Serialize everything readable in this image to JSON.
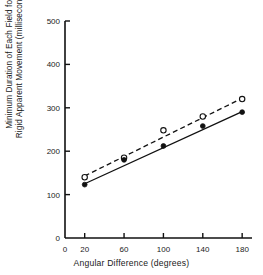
{
  "chart_data": {
    "type": "scatter",
    "title": "",
    "subtitle": "",
    "xlabel": "Angular Difference (degrees)",
    "ylabel_line1": "Minimum Duration of Each Field for",
    "ylabel_line2": "Rigid Apparent Movement (milliseconds)",
    "xlim": [
      0,
      190
    ],
    "ylim": [
      0,
      500
    ],
    "xticks": [
      0,
      20,
      60,
      100,
      140,
      180
    ],
    "xtick_labels": [
      "0",
      "20",
      "60",
      "100",
      "140",
      "180"
    ],
    "yticks": [
      0,
      100,
      200,
      300,
      400,
      500
    ],
    "ytick_labels": [
      "0",
      "100",
      "200",
      "300",
      "400",
      "500"
    ],
    "grid": false,
    "legend": "none",
    "x": [
      20,
      60,
      100,
      140,
      180
    ],
    "series": [
      {
        "name": "open-circle-series",
        "marker": "open-circle",
        "line_style": "dashed",
        "color": "#111111",
        "values": [
          140,
          185,
          248,
          280,
          320
        ],
        "fit_line": {
          "x": [
            20,
            180
          ],
          "y": [
            143,
            322
          ]
        }
      },
      {
        "name": "filled-circle-series",
        "marker": "filled-circle",
        "line_style": "solid",
        "color": "#111111",
        "values": [
          123,
          180,
          212,
          258,
          290
        ],
        "fit_line": {
          "x": [
            20,
            180
          ],
          "y": [
            125,
            291
          ]
        }
      }
    ],
    "axis_color": "#111111",
    "background": "#ffffff"
  }
}
